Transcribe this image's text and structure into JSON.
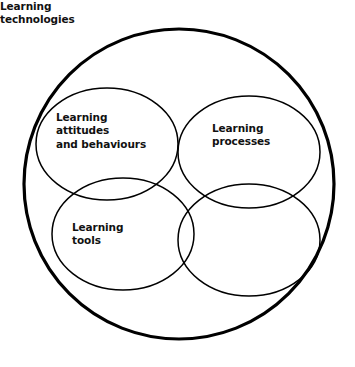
{
  "diagram": {
    "kind": "venn-diagram",
    "background_color": "#ffffff",
    "stroke_color": "#000000",
    "text_color": "#111111",
    "outer_boundary": {
      "name": "outer-circle",
      "shape": "circle",
      "cx": 179,
      "cy": 184,
      "r": 155,
      "stroke_width": 3.2
    },
    "sets": [
      {
        "id": "attitudes",
        "label": "Learning\nattitudes\nand behaviours",
        "label_lines": [
          "Learning",
          "attitudes",
          "and behaviours"
        ],
        "position": "top-left",
        "shape": "ellipse",
        "cx": 107,
        "cy": 144,
        "rx": 71,
        "ry": 56,
        "stroke_width": 1.5
      },
      {
        "id": "processes",
        "label": "Learning\nprocesses",
        "label_lines": [
          "Learning",
          "processes"
        ],
        "position": "top-right",
        "shape": "ellipse",
        "cx": 249,
        "cy": 152,
        "rx": 71,
        "ry": 56,
        "stroke_width": 1.5
      },
      {
        "id": "tools",
        "label": "Learning\ntools",
        "label_lines": [
          "Learning",
          "tools"
        ],
        "position": "bottom-left",
        "shape": "ellipse",
        "cx": 123,
        "cy": 234,
        "rx": 71,
        "ry": 56,
        "stroke_width": 1.5
      },
      {
        "id": "technologies",
        "label": "Learning\ntechnologies",
        "label_lines": [
          "Learning",
          "technologies"
        ],
        "position": "bottom-right",
        "shape": "ellipse",
        "cx": 249,
        "cy": 240,
        "rx": 71,
        "ry": 56,
        "stroke_width": 1.5
      }
    ],
    "intersection_point": {
      "x": 178,
      "y": 185
    }
  }
}
